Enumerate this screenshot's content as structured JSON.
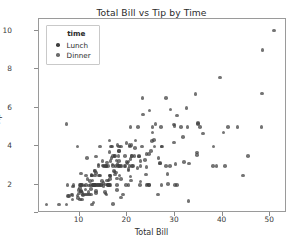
{
  "chart_data": {
    "type": "scatter",
    "title": "Total Bill vs Tip by Time",
    "xlabel": "Total Bill",
    "ylabel": "Tip",
    "xlim": [
      1.5,
      53.5
    ],
    "ylim": [
      0.55,
      10.6
    ],
    "xticks": [
      10,
      20,
      30,
      40,
      50
    ],
    "yticks": [
      2,
      4,
      6,
      8,
      10
    ],
    "grid": false,
    "legend": {
      "title": "time",
      "position": "upper-left-inside",
      "entries": [
        {
          "label": "Lunch",
          "color": "#3f3f3f"
        },
        {
          "label": "Dinner",
          "color": "#6b6b6b"
        }
      ]
    },
    "marker": {
      "shape": "circle",
      "size_px": 3.6,
      "opacity": 0.72,
      "color": "#3f3f3f"
    },
    "series": [
      {
        "name": "Lunch",
        "color": "#3f3f3f",
        "points": [
          [
            16.99,
            1.01
          ],
          [
            10.34,
            1.66
          ],
          [
            21.01,
            3.5
          ],
          [
            23.68,
            3.31
          ],
          [
            24.59,
            3.61
          ],
          [
            25.29,
            4.71
          ],
          [
            8.77,
            2.0
          ],
          [
            26.88,
            3.12
          ],
          [
            15.04,
            1.96
          ],
          [
            14.78,
            3.23
          ],
          [
            10.27,
            1.71
          ],
          [
            35.26,
            5.0
          ],
          [
            15.42,
            1.57
          ],
          [
            18.43,
            3.0
          ],
          [
            14.83,
            3.02
          ],
          [
            21.58,
            3.92
          ],
          [
            10.33,
            1.67
          ],
          [
            16.29,
            3.71
          ],
          [
            16.97,
            3.5
          ],
          [
            20.65,
            3.35
          ],
          [
            17.92,
            4.08
          ],
          [
            20.29,
            2.75
          ],
          [
            15.77,
            2.23
          ],
          [
            39.42,
            7.58
          ],
          [
            19.82,
            3.18
          ],
          [
            17.81,
            2.34
          ],
          [
            13.37,
            2.0
          ],
          [
            12.69,
            2.0
          ],
          [
            21.7,
            4.3
          ],
          [
            19.65,
            3.0
          ],
          [
            9.55,
            1.45
          ],
          [
            18.35,
            2.5
          ],
          [
            15.06,
            3.0
          ],
          [
            20.69,
            2.45
          ],
          [
            17.78,
            3.27
          ],
          [
            24.06,
            3.6
          ],
          [
            16.31,
            2.0
          ],
          [
            16.93,
            3.07
          ],
          [
            18.69,
            2.31
          ],
          [
            31.27,
            5.0
          ],
          [
            16.04,
            2.24
          ],
          [
            17.46,
            2.54
          ],
          [
            13.94,
            3.06
          ],
          [
            9.68,
            1.32
          ],
          [
            30.4,
            5.6
          ],
          [
            18.29,
            3.0
          ],
          [
            22.23,
            5.0
          ],
          [
            32.4,
            6.0
          ],
          [
            28.55,
            2.05
          ],
          [
            18.04,
            3.0
          ],
          [
            12.54,
            2.5
          ],
          [
            10.29,
            2.6
          ],
          [
            34.81,
            5.2
          ],
          [
            9.94,
            1.56
          ],
          [
            25.56,
            4.34
          ],
          [
            19.49,
            3.51
          ],
          [
            38.01,
            3.0
          ],
          [
            26.41,
            1.5
          ],
          [
            11.24,
            1.76
          ],
          [
            48.27,
            6.73
          ],
          [
            20.29,
            3.21
          ],
          [
            13.81,
            2.0
          ],
          [
            11.02,
            1.98
          ],
          [
            18.29,
            3.76
          ],
          [
            17.59,
            2.64
          ],
          [
            20.08,
            3.15
          ],
          [
            16.45,
            2.47
          ],
          [
            3.07,
            1.0
          ],
          [
            20.23,
            2.01
          ],
          [
            15.01,
            2.09
          ],
          [
            12.02,
            1.97
          ],
          [
            17.07,
            3.0
          ],
          [
            26.86,
            3.14
          ],
          [
            25.28,
            5.0
          ],
          [
            14.73,
            2.2
          ],
          [
            10.51,
            1.25
          ],
          [
            17.92,
            3.08
          ],
          [
            27.2,
            4.0
          ],
          [
            22.76,
            3.0
          ],
          [
            17.29,
            2.71
          ],
          [
            19.44,
            3.0
          ],
          [
            16.66,
            3.4
          ],
          [
            10.07,
            1.83
          ],
          [
            32.68,
            5.0
          ],
          [
            15.98,
            2.03
          ],
          [
            34.83,
            5.17
          ],
          [
            13.03,
            2.0
          ],
          [
            18.28,
            4.0
          ],
          [
            24.71,
            5.85
          ],
          [
            21.16,
            3.0
          ]
        ]
      },
      {
        "name": "Dinner",
        "color": "#6b6b6b",
        "points": [
          [
            28.97,
            3.0
          ],
          [
            22.49,
            3.5
          ],
          [
            5.75,
            1.0
          ],
          [
            16.32,
            4.3
          ],
          [
            22.75,
            3.25
          ],
          [
            40.17,
            4.73
          ],
          [
            27.28,
            4.0
          ],
          [
            12.03,
            1.5
          ],
          [
            21.01,
            3.0
          ],
          [
            12.46,
            1.5
          ],
          [
            11.35,
            2.5
          ],
          [
            15.38,
            3.0
          ],
          [
            44.3,
            2.5
          ],
          [
            22.42,
            3.48
          ],
          [
            20.92,
            4.08
          ],
          [
            15.36,
            1.64
          ],
          [
            20.49,
            4.06
          ],
          [
            25.21,
            4.29
          ],
          [
            18.24,
            3.76
          ],
          [
            14.31,
            4.0
          ],
          [
            14.0,
            3.0
          ],
          [
            7.25,
            1.0
          ],
          [
            38.07,
            4.0
          ],
          [
            23.95,
            2.55
          ],
          [
            25.71,
            4.0
          ],
          [
            17.31,
            3.5
          ],
          [
            29.93,
            5.07
          ],
          [
            10.65,
            1.5
          ],
          [
            12.43,
            1.8
          ],
          [
            24.08,
            2.92
          ],
          [
            11.69,
            2.31
          ],
          [
            13.42,
            1.68
          ],
          [
            14.26,
            2.5
          ],
          [
            15.95,
            2.0
          ],
          [
            12.48,
            2.52
          ],
          [
            29.8,
            4.2
          ],
          [
            8.52,
            1.48
          ],
          [
            14.52,
            2.0
          ],
          [
            11.38,
            2.0
          ],
          [
            22.82,
            2.18
          ],
          [
            19.08,
            1.5
          ],
          [
            20.27,
            2.83
          ],
          [
            11.17,
            1.5
          ],
          [
            12.26,
            2.0
          ],
          [
            18.26,
            3.25
          ],
          [
            8.51,
            1.25
          ],
          [
            10.33,
            2.0
          ],
          [
            14.15,
            2.0
          ],
          [
            16.0,
            2.0
          ],
          [
            13.16,
            2.75
          ],
          [
            17.47,
            3.5
          ],
          [
            34.3,
            6.7
          ],
          [
            41.19,
            5.0
          ],
          [
            27.05,
            5.0
          ],
          [
            16.43,
            2.3
          ],
          [
            8.35,
            1.5
          ],
          [
            18.64,
            1.36
          ],
          [
            11.87,
            1.63
          ],
          [
            9.78,
            1.73
          ],
          [
            7.51,
            2.0
          ],
          [
            14.07,
            2.5
          ],
          [
            13.13,
            2.0
          ],
          [
            17.26,
            2.74
          ],
          [
            24.55,
            2.0
          ],
          [
            19.77,
            2.0
          ],
          [
            29.85,
            5.14
          ],
          [
            48.17,
            5.0
          ],
          [
            25.0,
            3.75
          ],
          [
            13.39,
            2.61
          ],
          [
            16.49,
            2.0
          ],
          [
            21.5,
            3.5
          ],
          [
            12.66,
            2.5
          ],
          [
            16.21,
            2.0
          ],
          [
            13.81,
            2.0
          ],
          [
            17.51,
            3.0
          ],
          [
            24.52,
            2.0
          ],
          [
            20.76,
            2.24
          ],
          [
            31.71,
            4.5
          ],
          [
            10.59,
            1.61
          ],
          [
            10.63,
            2.0
          ],
          [
            50.81,
            10.0
          ],
          [
            15.81,
            3.16
          ],
          [
            7.25,
            5.15
          ],
          [
            31.85,
            3.18
          ],
          [
            16.82,
            4.0
          ],
          [
            32.9,
            3.11
          ],
          [
            17.89,
            2.0
          ],
          [
            14.48,
            2.0
          ],
          [
            9.6,
            4.0
          ],
          [
            34.63,
            3.55
          ],
          [
            34.65,
            3.68
          ],
          [
            23.33,
            5.65
          ],
          [
            45.35,
            3.5
          ],
          [
            23.17,
            6.5
          ],
          [
            40.55,
            3.0
          ],
          [
            20.69,
            5.0
          ],
          [
            20.9,
            3.5
          ],
          [
            30.46,
            2.0
          ],
          [
            18.15,
            3.5
          ],
          [
            23.1,
            4.0
          ],
          [
            15.69,
            1.5
          ],
          [
            19.81,
            4.19
          ],
          [
            28.44,
            2.56
          ],
          [
            15.48,
            2.02
          ],
          [
            16.58,
            4.0
          ],
          [
            7.56,
            1.44
          ],
          [
            10.34,
            2.0
          ],
          [
            43.11,
            5.0
          ],
          [
            13.0,
            2.0
          ],
          [
            13.51,
            2.0
          ],
          [
            18.71,
            4.0
          ],
          [
            12.74,
            2.01
          ],
          [
            13.0,
            2.0
          ],
          [
            16.4,
            2.5
          ],
          [
            20.53,
            4.0
          ],
          [
            16.47,
            3.23
          ],
          [
            26.59,
            3.41
          ],
          [
            38.73,
            3.0
          ],
          [
            24.27,
            2.03
          ],
          [
            12.76,
            2.23
          ],
          [
            30.06,
            2.0
          ],
          [
            25.89,
            5.16
          ],
          [
            48.33,
            9.0
          ],
          [
            13.27,
            2.5
          ],
          [
            28.17,
            6.5
          ],
          [
            12.9,
            1.1
          ],
          [
            28.15,
            3.0
          ],
          [
            11.59,
            1.5
          ],
          [
            7.74,
            1.44
          ],
          [
            30.14,
            3.09
          ],
          [
            12.16,
            2.2
          ],
          [
            13.42,
            3.48
          ],
          [
            8.58,
            1.92
          ],
          [
            15.98,
            3.0
          ],
          [
            13.42,
            1.58
          ],
          [
            16.27,
            2.5
          ],
          [
            10.09,
            2.0
          ],
          [
            20.45,
            3.0
          ],
          [
            13.28,
            2.72
          ],
          [
            22.12,
            2.88
          ],
          [
            24.01,
            2.0
          ],
          [
            15.69,
            3.0
          ],
          [
            11.61,
            3.39
          ],
          [
            10.77,
            1.47
          ],
          [
            15.53,
            3.0
          ],
          [
            10.07,
            1.25
          ],
          [
            12.6,
            1.0
          ],
          [
            32.83,
            1.17
          ],
          [
            35.83,
            4.67
          ],
          [
            29.03,
            5.92
          ],
          [
            27.18,
            2.0
          ],
          [
            22.67,
            2.0
          ],
          [
            17.82,
            1.75
          ],
          [
            18.78,
            3.0
          ]
        ]
      }
    ]
  }
}
